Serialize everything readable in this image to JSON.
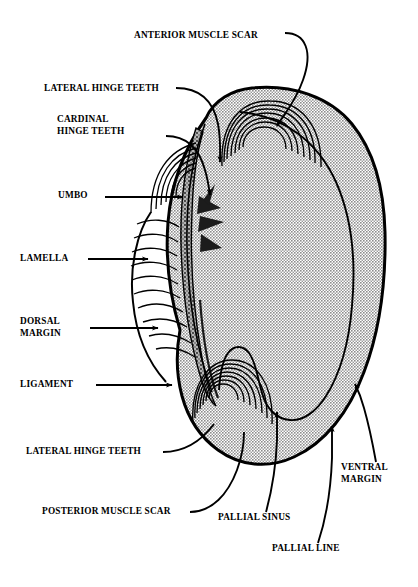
{
  "figure": {
    "view": "interior of left valve",
    "background_color": "#ffffff",
    "line_color": "#000000",
    "shell_fill_color": "#b3b3b3",
    "shell_fill_style": "halftone-stipple",
    "width": 418,
    "height": 587
  },
  "labels": [
    {
      "id": "anterior-muscle-scar",
      "text": "ANTERIOR MUSCLE SCAR",
      "x": 134,
      "y": 30,
      "align": "left",
      "leader": "curve-right-down",
      "tip": "arrow"
    },
    {
      "id": "lateral-hinge-teeth-top",
      "text": "LATERAL HINGE TEETH",
      "x": 44,
      "y": 83,
      "align": "left",
      "leader": "curve-right-down",
      "tip": "arrow"
    },
    {
      "id": "cardinal-hinge-teeth",
      "text": "CARDINAL\nHINGE TEETH",
      "x": 57,
      "y": 114,
      "align": "left",
      "leader": "curve-right-down",
      "tip": "arrow"
    },
    {
      "id": "umbo",
      "text": "UMBO",
      "x": 58,
      "y": 190,
      "align": "left",
      "leader": "straight-right",
      "tip": "arrow"
    },
    {
      "id": "lamella",
      "text": "LAMELLA",
      "x": 20,
      "y": 256,
      "align": "left",
      "leader": "straight-right",
      "tip": "arrow"
    },
    {
      "id": "dorsal-margin",
      "text": "DORSAL\nMARGIN",
      "x": 20,
      "y": 322,
      "align": "left",
      "leader": "straight-right",
      "tip": "arrow"
    },
    {
      "id": "ligament",
      "text": "LIGAMENT",
      "x": 20,
      "y": 381,
      "align": "left",
      "leader": "straight-right",
      "tip": "arrow"
    },
    {
      "id": "lateral-hinge-teeth-bottom",
      "text": "LATERAL HINGE TEETH",
      "x": 26,
      "y": 458,
      "align": "left",
      "leader": "curve-up-right",
      "tip": "plain"
    },
    {
      "id": "posterior-muscle-scar",
      "text": "POSTERIOR MUSCLE SCAR",
      "x": 42,
      "y": 516,
      "align": "left",
      "leader": "curve-up-right",
      "tip": "plain"
    },
    {
      "id": "pallial-sinus",
      "text": "PALLIAL SINUS",
      "x": 218,
      "y": 518,
      "align": "left",
      "leader": "curve-up",
      "tip": "arrow"
    },
    {
      "id": "pallial-line",
      "text": "PALLIAL LINE",
      "x": 272,
      "y": 549,
      "align": "left",
      "leader": "curve-up",
      "tip": "arrow"
    },
    {
      "id": "ventral-margin",
      "text": "VENTRAL\nMARGIN",
      "x": 341,
      "y": 470,
      "align": "left",
      "leader": "curve-up-left",
      "tip": "arrow"
    }
  ],
  "structures": [
    {
      "id": "shell-outline",
      "name": "shell outline",
      "description": "large rounded valve body, filled grey"
    },
    {
      "id": "pallial-line-curve",
      "name": "pallial line",
      "description": "inner curve parallel to ventral margin"
    },
    {
      "id": "pallial-sinus-notch",
      "name": "pallial sinus",
      "description": "U-shaped embayment in pallial line"
    },
    {
      "id": "anterior-muscle-scar-arcs",
      "name": "anterior muscle scar",
      "description": "nested concentric arcs, upper area"
    },
    {
      "id": "posterior-muscle-scar-arcs",
      "name": "posterior muscle scar",
      "description": "nested concentric arcs, lower area"
    },
    {
      "id": "umbo-arcs",
      "name": "umbo",
      "description": "concentric growth arcs at beak"
    },
    {
      "id": "lamella-ridges",
      "name": "lamella",
      "description": "stacked curved ridges along dorsal edge"
    },
    {
      "id": "hinge-plate",
      "name": "hinge plate",
      "description": "elongated stippled band with teeth"
    },
    {
      "id": "ligament-band",
      "name": "ligament",
      "description": "narrow band below hinge"
    }
  ]
}
